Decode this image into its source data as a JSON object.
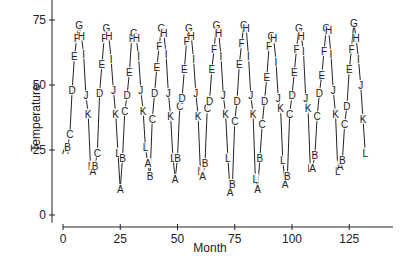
{
  "chart_data": {
    "type": "line",
    "title": "",
    "xlabel": "Month",
    "ylabel": "Temperature",
    "xlim": [
      0,
      144
    ],
    "ylim": [
      0,
      80
    ],
    "x_ticks": [
      0,
      25,
      50,
      75,
      100,
      125
    ],
    "y_ticks": [
      0,
      25,
      50,
      75
    ],
    "grid": false,
    "legend": "none",
    "point_symbols": [
      "A",
      "B",
      "C",
      "D",
      "E",
      "F",
      "G",
      "H",
      "I",
      "J",
      "K",
      "L"
    ],
    "series": [
      {
        "name": "Temperature",
        "values": [
          25,
          26,
          31,
          48,
          61,
          68,
          73,
          69,
          62,
          46,
          39,
          19,
          17,
          19,
          24,
          47,
          58,
          68,
          72,
          69,
          60,
          48,
          39,
          24,
          10,
          22,
          40,
          46,
          55,
          68,
          70,
          68,
          61,
          48,
          40,
          26,
          20,
          15,
          37,
          47,
          57,
          65,
          72,
          70,
          62,
          47,
          38,
          22,
          14,
          22,
          42,
          45,
          56,
          67,
          72,
          69,
          60,
          47,
          38,
          17,
          15,
          20,
          41,
          44,
          56,
          64,
          73,
          70,
          61,
          46,
          39,
          22,
          9,
          12,
          36,
          44,
          58,
          66,
          73,
          72,
          61,
          46,
          39,
          14,
          10,
          22,
          35,
          44,
          53,
          65,
          69,
          68,
          59,
          45,
          41,
          21,
          12,
          15,
          39,
          46,
          55,
          64,
          72,
          69,
          63,
          45,
          41,
          18,
          18,
          23,
          38,
          47,
          54,
          63,
          72,
          71,
          62,
          48,
          39,
          17,
          19,
          21,
          35,
          42,
          56,
          64,
          74,
          68,
          60,
          50,
          37,
          24
        ]
      }
    ]
  },
  "axes": {
    "x_title": "Month",
    "y_title": "Temperature",
    "x_tick_labels": [
      "0",
      "25",
      "50",
      "75",
      "100",
      "125"
    ],
    "y_tick_labels": [
      "0",
      "25",
      "50",
      "75"
    ]
  },
  "colors": {
    "line": "#222222",
    "axis": "#222222",
    "background": "#ffffff"
  }
}
